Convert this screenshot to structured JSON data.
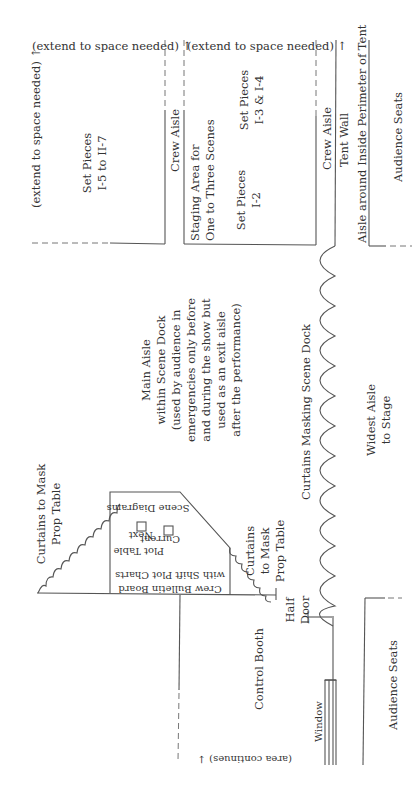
{
  "diagram": {
    "type": "floor-plan",
    "orientation": "rotated 90 degrees counter-clockwise",
    "labels": {
      "extend_top_left": "(extend to space needed) ↑",
      "extend_side_left": "(extend to space needed) ↑",
      "extend_top_right": "(extend to space needed) ↑",
      "set_pieces_i5": [
        "Set Pieces",
        "I-5 to II-7"
      ],
      "crew_aisle_1": "Crew Aisle",
      "staging_area": [
        "Staging Area for",
        "One to Three Scenes"
      ],
      "set_pieces_i2": [
        "Set Pieces",
        "I-2"
      ],
      "set_pieces_i3": [
        "Set Pieces",
        "I-3 & I-4"
      ],
      "crew_aisle_2": "Crew Aisle",
      "tent_wall": "Tent Wall",
      "perimeter_aisle": "Aisle around Inside Perimeter of Tent",
      "audience_seats_top": "Audience Seats",
      "main_aisle": [
        "Main Aisle",
        "within Scene Dock",
        "(used by audience in",
        "emergencies only before",
        "and during the show but",
        "used as an exit aisle",
        "after the performance)"
      ],
      "curtains_mask_left": [
        "Curtains to Mask",
        "Prop Table"
      ],
      "curtains_mask_right": [
        "Curtains",
        "to Mask",
        "Prop Table"
      ],
      "scene_diagrams": "Scene Diagrams",
      "current": "Current",
      "next": "Next",
      "plot_table": "Plot Table",
      "bulletin_board": [
        "Crew Bulletin Board",
        "with Shift Plot Charts"
      ],
      "curtains_scene_dock": "Curtains Masking Scene Dock",
      "widest_aisle": [
        "Widest Aisle",
        "to Stage"
      ],
      "half_door": [
        "Half",
        "Door"
      ],
      "control_booth": "Control Booth",
      "window": "Window",
      "area_continues": "(area continues) ↓",
      "audience_seats_bottom": "Audience Seats"
    }
  }
}
